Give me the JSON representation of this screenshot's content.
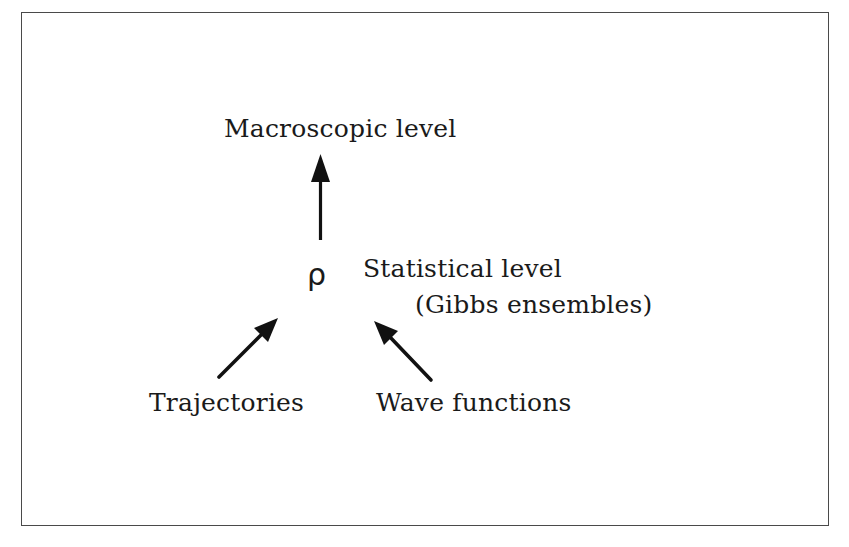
{
  "diagram": {
    "nodes": {
      "macroscopic": {
        "label": "Macroscopic level"
      },
      "rho": {
        "symbol": "ρ"
      },
      "statistical": {
        "label": "Statistical level",
        "sublabel": "(Gibbs ensembles)"
      },
      "trajectories": {
        "label": "Trajectories"
      },
      "wave_functions": {
        "label": "Wave functions"
      }
    },
    "edges": [
      {
        "from": "rho",
        "to": "macroscopic",
        "direction": "up"
      },
      {
        "from": "trajectories",
        "to": "rho",
        "direction": "up-right"
      },
      {
        "from": "wave_functions",
        "to": "rho",
        "direction": "up-left"
      }
    ],
    "colors": {
      "text": "#1a1a1a",
      "arrow": "#111111",
      "frame": "#4a4a4a",
      "background": "#ffffff"
    }
  }
}
